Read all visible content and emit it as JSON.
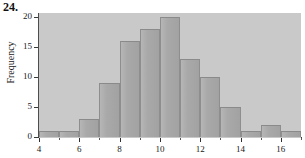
{
  "figure": {
    "problem_number": "24.",
    "background_color": "#ffffff",
    "plot_background_color": "#c9c9c9",
    "bar_color": "#a9a9a9",
    "bar_edge_color": "#8e8e8e",
    "axis_color": "#3a3a3a"
  },
  "chart_data": {
    "type": "bar",
    "title": "",
    "subtitle": "",
    "xlabel": "",
    "ylabel": "Frequency",
    "xlim": [
      4,
      17
    ],
    "ylim": [
      0,
      21
    ],
    "grid": false,
    "legend": null,
    "bin_width": 1,
    "bin_edges": [
      4,
      5,
      6,
      7,
      8,
      9,
      10,
      11,
      12,
      13,
      14,
      15,
      16,
      17
    ],
    "categories": [
      "4-5",
      "5-6",
      "6-7",
      "7-8",
      "8-9",
      "9-10",
      "10-11",
      "11-12",
      "12-13",
      "13-14",
      "14-15",
      "15-16",
      "16-17"
    ],
    "values": [
      1,
      1,
      3,
      9,
      16,
      18,
      20,
      13,
      10,
      5,
      1,
      2,
      1
    ],
    "x_tick_labels": [
      "4",
      "6",
      "8",
      "10",
      "12",
      "14",
      "16"
    ],
    "x_tick_values": [
      4,
      6,
      8,
      10,
      12,
      14,
      16
    ],
    "x_minor_tick_values": [
      5,
      7,
      9,
      11,
      13,
      15,
      17
    ],
    "y_tick_labels": [
      "0",
      "5",
      "10",
      "15",
      "20"
    ],
    "y_tick_values": [
      0,
      5,
      10,
      15,
      20
    ],
    "total_count": 100
  }
}
